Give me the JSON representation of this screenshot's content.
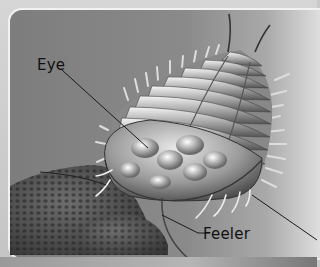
{
  "figure": {
    "labels": [
      {
        "id": "eye",
        "text": "Eye"
      },
      {
        "id": "feeler",
        "text": "Feeler"
      }
    ],
    "colors": {
      "background": "#8a8a8a",
      "frame": "#d0d0d0",
      "leader_line": "#1a1a1a"
    }
  }
}
